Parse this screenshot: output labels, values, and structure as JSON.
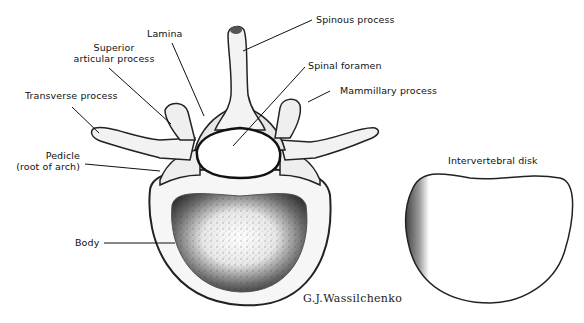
{
  "figure": {
    "labels": {
      "spinous_process": "Spinous process",
      "lamina": "Lamina",
      "superior_articular_process_line1": "Superior",
      "superior_articular_process_line2": "articular process",
      "spinal_foramen": "Spinal foramen",
      "mammillary_process": "Mammillary process",
      "transverse_process": "Transverse process",
      "pedicle_line1": "Pedicle",
      "pedicle_line2": "(root of arch)",
      "body": "Body",
      "intervertebral_disk": "Intervertebral disk"
    },
    "signature": "G.J.Wassilchenko",
    "colors": {
      "background": "#ffffff",
      "ink": "#111111",
      "bone_fill": "#f4f4f4",
      "shade": "#555555"
    }
  }
}
